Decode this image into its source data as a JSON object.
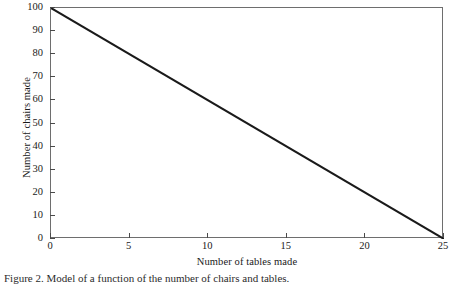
{
  "figure": {
    "caption": "Figure 2. Model of a function of the number of chairs and tables."
  },
  "chart_data": {
    "type": "line",
    "title": "",
    "xlabel": "Number of tables made",
    "ylabel": "Number of chairs made",
    "xlim": [
      0,
      25
    ],
    "ylim": [
      0,
      100
    ],
    "xticks": [
      0,
      5,
      10,
      15,
      20,
      25
    ],
    "yticks": [
      0,
      10,
      20,
      30,
      40,
      50,
      60,
      70,
      80,
      90,
      100
    ],
    "xtick_labels": [
      "0",
      "5",
      "10",
      "15",
      "20",
      "25"
    ],
    "ytick_labels": [
      "0",
      "10",
      "20",
      "30",
      "40",
      "50",
      "60",
      "70",
      "80",
      "90",
      "100"
    ],
    "grid": false,
    "legend": false,
    "frame": true,
    "line_color": "#1a1a1a",
    "line_width": 2,
    "series": [
      {
        "name": "chairs vs tables",
        "x": [
          0,
          25
        ],
        "values": [
          100,
          0
        ],
        "points": [
          [
            0,
            100
          ],
          [
            25,
            0
          ]
        ],
        "equation": "y = 100 - 4x"
      }
    ]
  }
}
